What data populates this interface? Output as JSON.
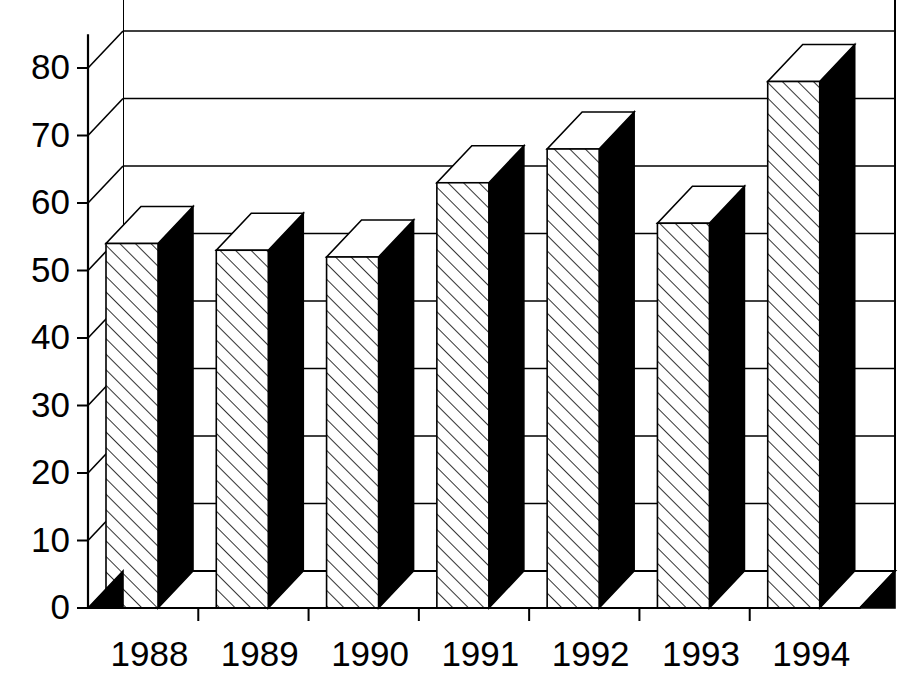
{
  "chart_data": {
    "type": "bar",
    "title": "",
    "subtitle": "",
    "xlabel": "",
    "ylabel": "",
    "categories": [
      "1988",
      "1989",
      "1990",
      "1991",
      "1992",
      "1993",
      "1994"
    ],
    "values": [
      54,
      53,
      52,
      63,
      68,
      57,
      78
    ],
    "series": [
      {
        "name": "",
        "values": [
          54,
          53,
          52,
          63,
          68,
          57,
          78
        ]
      }
    ],
    "ylim": [
      0,
      85
    ],
    "yticks": [
      0,
      10,
      20,
      30,
      40,
      50,
      60,
      70,
      80
    ],
    "ytick_labels": [
      "0",
      "10",
      "20",
      "30",
      "40",
      "50",
      "60",
      "70",
      "80"
    ],
    "xtick_labels": [
      "1988",
      "1989",
      "1990",
      "1991",
      "1992",
      "1993",
      "1994"
    ],
    "grid": true,
    "gridlines_at": [
      10,
      20,
      30,
      40,
      50,
      60,
      70,
      80
    ],
    "legend": false,
    "legend_position": "none",
    "style": "3d-column",
    "bar_front_fill": "hatch-diagonal",
    "bar_side_fill": "#000000",
    "bar_top_fill": "#ffffff",
    "annotations": [],
    "colors": {
      "axis": "#000000",
      "grid": "#000000",
      "background": "#ffffff",
      "bar_dark": "#000000",
      "bar_light": "#ffffff"
    }
  },
  "axes": {
    "y_axis_name": "value-axis",
    "x_axis_name": "year-axis"
  }
}
